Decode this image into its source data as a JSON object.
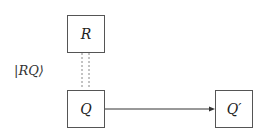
{
  "diagram": {
    "nodes": [
      {
        "id": "R",
        "label": "R"
      },
      {
        "id": "Q",
        "label": "Q"
      },
      {
        "id": "Qprime",
        "label": "Q′"
      }
    ],
    "edges": [
      {
        "from": "R",
        "to": "Q",
        "style": "dotted-double",
        "label": "|RQ⟩"
      },
      {
        "from": "Q",
        "to": "Qprime",
        "style": "solid-arrow"
      }
    ],
    "entanglement_label": "|RQ⟩"
  }
}
